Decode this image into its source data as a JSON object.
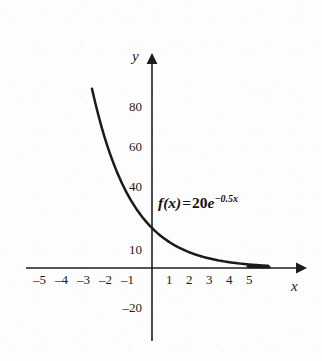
{
  "chart_data": {
    "type": "line",
    "title": "",
    "subtitle": "",
    "xlabel": "x",
    "ylabel": "y",
    "grid": false,
    "legend": null,
    "xlim": [
      -5.8,
      6.5
    ],
    "ylim": [
      -28,
      96
    ],
    "x_ticks": [
      -5,
      -4,
      -3,
      -2,
      -1,
      1,
      2,
      3,
      4,
      5
    ],
    "x_tick_labels": [
      "–5",
      "–4",
      "–3",
      "–2",
      "–1",
      "1",
      "2",
      "3",
      "4",
      "5"
    ],
    "y_ticks": [
      80,
      60,
      40,
      10,
      -20
    ],
    "y_tick_labels": [
      "80",
      "60",
      "40",
      "10",
      "–20"
    ],
    "series": [
      {
        "name": "f(x) = 20e^(-0.5x)",
        "equation_plain": "f(x) = 20e^{-0.5x}",
        "coefficient": 20,
        "rate": -0.5,
        "x": [
          -3.0,
          -2.5,
          -2.0,
          -1.5,
          -1.0,
          -0.5,
          0.0,
          0.5,
          1.0,
          1.5,
          2.0,
          2.5,
          3.0,
          3.5,
          4.0,
          4.5,
          5.0,
          5.5,
          5.8
        ],
        "y": [
          89.6,
          69.8,
          54.4,
          42.3,
          33.0,
          25.7,
          20.0,
          15.6,
          12.1,
          9.4,
          7.4,
          5.7,
          4.5,
          3.5,
          2.7,
          2.1,
          1.6,
          1.3,
          1.1
        ]
      }
    ],
    "annotations": [
      {
        "name": "function-equation",
        "parts": {
          "fx": "f(x)",
          "equals": "=",
          "coefficient": "20",
          "base": "e",
          "exponent": "−0.5x"
        }
      }
    ]
  },
  "axes": {
    "y_axis_name": "y",
    "x_axis_name": "x"
  }
}
